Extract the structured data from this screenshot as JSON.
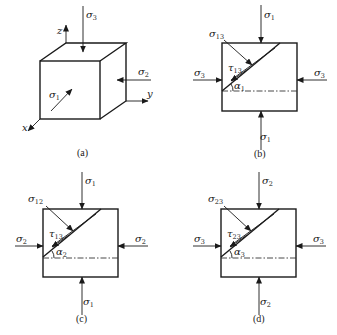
{
  "figure": {
    "panels": [
      {
        "id": "a",
        "caption": "(a)",
        "type": "cube",
        "labels": {
          "top_stress": {
            "sym": "σ",
            "sub": "3"
          },
          "side_stress": {
            "sym": "σ",
            "sub": "2"
          },
          "front_stress": {
            "sym": "σ",
            "sub": "1"
          },
          "axis_x": "x",
          "axis_y": "y",
          "axis_z": "z"
        }
      },
      {
        "id": "b",
        "caption": "(b)",
        "type": "section",
        "labels": {
          "top": {
            "sym": "σ",
            "sub": "1"
          },
          "bottom": {
            "sym": "σ",
            "sub": "1"
          },
          "left": {
            "sym": "σ",
            "sub": "3"
          },
          "right": {
            "sym": "σ",
            "sub": "3"
          },
          "normal": {
            "sym": "σ",
            "sub": "13"
          },
          "shear": {
            "sym": "τ",
            "sub": "13"
          },
          "angle": {
            "sym": "α",
            "sub": "1"
          }
        }
      },
      {
        "id": "c",
        "caption": "(c)",
        "type": "section",
        "labels": {
          "top": {
            "sym": "σ",
            "sub": "1"
          },
          "bottom": {
            "sym": "σ",
            "sub": "1"
          },
          "left": {
            "sym": "σ",
            "sub": "2"
          },
          "right": {
            "sym": "σ",
            "sub": "2"
          },
          "normal": {
            "sym": "σ",
            "sub": "12"
          },
          "shear": {
            "sym": "τ",
            "sub": "13"
          },
          "angle": {
            "sym": "α",
            "sub": "2"
          }
        }
      },
      {
        "id": "d",
        "caption": "(d)",
        "type": "section",
        "labels": {
          "top": {
            "sym": "σ",
            "sub": "2"
          },
          "bottom": {
            "sym": "σ",
            "sub": "2"
          },
          "left": {
            "sym": "σ",
            "sub": "3"
          },
          "right": {
            "sym": "σ",
            "sub": "3"
          },
          "normal": {
            "sym": "σ",
            "sub": "23"
          },
          "shear": {
            "sym": "τ",
            "sub": "23"
          },
          "angle": {
            "sym": "α",
            "sub": "3"
          }
        }
      }
    ]
  }
}
